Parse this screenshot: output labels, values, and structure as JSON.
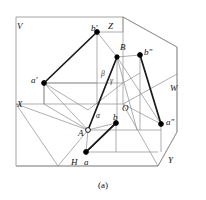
{
  "figure": {
    "caption": "(a)",
    "colors": {
      "frame": "#9a9a9a",
      "thin_line": "#8d8d8d",
      "bold_line": "#1a1a1a",
      "point_fill": "#000000",
      "point_open_fill": "#ffffff",
      "text": "#111111",
      "background": "#ffffff"
    },
    "plane_labels": [
      {
        "id": "plane-v",
        "text": "V",
        "x": 17,
        "y": 22
      },
      {
        "id": "plane-w",
        "text": "W",
        "x": 170,
        "y": 84
      },
      {
        "id": "plane-h",
        "text": "H",
        "x": 71,
        "y": 158
      }
    ],
    "axis_labels": [
      {
        "id": "axis-z",
        "text": "Z",
        "x": 108,
        "y": 22
      },
      {
        "id": "axis-x",
        "text": "X",
        "x": 17,
        "y": 100
      },
      {
        "id": "axis-y",
        "text": "Y",
        "x": 168,
        "y": 156
      },
      {
        "id": "axis-o",
        "text": "O",
        "x": 122,
        "y": 104
      }
    ],
    "point_labels": [
      {
        "id": "point-b-prime",
        "text": "b'",
        "x": 91,
        "y": 24
      },
      {
        "id": "point-b",
        "text": "B",
        "x": 120,
        "y": 43
      },
      {
        "id": "point-b-dprime",
        "text": "b\"",
        "x": 144,
        "y": 48
      },
      {
        "id": "point-a-prime",
        "text": "a'",
        "x": 31,
        "y": 76
      },
      {
        "id": "point-a-dprime",
        "text": "a\"",
        "x": 166,
        "y": 118
      },
      {
        "id": "point-b-lower",
        "text": "b",
        "x": 113,
        "y": 113
      },
      {
        "id": "point-a-upper",
        "text": "A",
        "x": 78,
        "y": 129
      },
      {
        "id": "point-a-lower",
        "text": "a",
        "x": 84,
        "y": 158
      }
    ],
    "angle_labels": [
      {
        "id": "angle-beta",
        "text": "β",
        "x": 101,
        "y": 70
      },
      {
        "id": "angle-gamma",
        "text": "γ",
        "x": 110,
        "y": 77
      },
      {
        "id": "angle-alpha",
        "text": "α",
        "x": 96,
        "y": 112
      }
    ],
    "points": [
      {
        "id": "vertex-b-prime",
        "cx": 97,
        "cy": 32,
        "r": 2.4,
        "filled": true
      },
      {
        "id": "vertex-B",
        "cx": 117,
        "cy": 57,
        "r": 2.2,
        "filled": true
      },
      {
        "id": "vertex-b-dprime",
        "cx": 140,
        "cy": 55,
        "r": 2.4,
        "filled": true
      },
      {
        "id": "vertex-a-prime",
        "cx": 44,
        "cy": 83,
        "r": 2.4,
        "filled": true
      },
      {
        "id": "vertex-a-dprime",
        "cx": 161,
        "cy": 124,
        "r": 2.4,
        "filled": true
      },
      {
        "id": "vertex-b-lower",
        "cx": 116,
        "cy": 123,
        "r": 2.4,
        "filled": true
      },
      {
        "id": "vertex-A",
        "cx": 88,
        "cy": 130,
        "r": 2.4,
        "filled": false
      },
      {
        "id": "vertex-a-lower",
        "cx": 86,
        "cy": 152,
        "r": 2.4,
        "filled": true
      }
    ],
    "frame_outline": "16,17 123,17 177,47 177,132 158,166 16,166 16,17",
    "bold_segments": [
      {
        "id": "seg-a-prime-b-prime",
        "x1": 44,
        "y1": 83,
        "x2": 97,
        "y2": 32
      },
      {
        "id": "seg-A-B",
        "x1": 88,
        "y1": 130,
        "x2": 117,
        "y2": 57
      },
      {
        "id": "seg-a-b",
        "x1": 86,
        "y1": 152,
        "x2": 116,
        "y2": 123
      },
      {
        "id": "seg-b-dprime-a-dprime",
        "x1": 140,
        "y1": 55,
        "x2": 161,
        "y2": 124
      },
      {
        "id": "seg-a-lower-to-a-dprime",
        "x1": 86,
        "y1": 152,
        "x2": 116,
        "y2": 123
      }
    ],
    "thin_segments": [
      {
        "id": "plane-v-right-edge",
        "x1": 123,
        "y1": 17,
        "x2": 123,
        "y2": 104
      },
      {
        "id": "axis-x-line",
        "x1": 16,
        "y1": 104,
        "x2": 123,
        "y2": 104
      },
      {
        "id": "axis-oy-line",
        "x1": 123,
        "y1": 104,
        "x2": 158,
        "y2": 166
      },
      {
        "id": "axis-ow-line",
        "x1": 123,
        "y1": 104,
        "x2": 177,
        "y2": 74
      },
      {
        "id": "h-plane-front",
        "x1": 16,
        "y1": 166,
        "x2": 158,
        "y2": 166
      },
      {
        "id": "h-plane-left-diag",
        "x1": 16,
        "y1": 104,
        "x2": 58,
        "y2": 166
      },
      {
        "id": "w-plane-upper",
        "x1": 123,
        "y1": 17,
        "x2": 177,
        "y2": 47
      },
      {
        "id": "proj-a-prime-down",
        "x1": 44,
        "y1": 83,
        "x2": 44,
        "y2": 104
      },
      {
        "id": "proj-a-prime-right",
        "x1": 44,
        "y1": 83,
        "x2": 123,
        "y2": 83
      },
      {
        "id": "proj-b-prime-down",
        "x1": 97,
        "y1": 32,
        "x2": 97,
        "y2": 104
      },
      {
        "id": "proj-b-prime-right",
        "x1": 97,
        "y1": 32,
        "x2": 123,
        "y2": 32
      },
      {
        "id": "proj-B-vert",
        "x1": 117,
        "y1": 57,
        "x2": 117,
        "y2": 123
      },
      {
        "id": "proj-B-to-b-dprime",
        "x1": 117,
        "y1": 57,
        "x2": 140,
        "y2": 55
      },
      {
        "id": "proj-B-to-b-prime",
        "x1": 97,
        "y1": 32,
        "x2": 117,
        "y2": 57
      },
      {
        "id": "proj-A-to-a-prime",
        "x1": 44,
        "y1": 83,
        "x2": 88,
        "y2": 130
      },
      {
        "id": "proj-A-to-a-lower",
        "x1": 88,
        "y1": 130,
        "x2": 86,
        "y2": 152
      },
      {
        "id": "proj-A-to-b-lower",
        "x1": 88,
        "y1": 130,
        "x2": 116,
        "y2": 123
      },
      {
        "id": "proj-A-horiz",
        "x1": 88,
        "y1": 130,
        "x2": 161,
        "y2": 130
      },
      {
        "id": "proj-a-lower-horiz",
        "x1": 86,
        "y1": 152,
        "x2": 158,
        "y2": 152
      },
      {
        "id": "proj-a-dprime-vert",
        "x1": 161,
        "y1": 124,
        "x2": 161,
        "y2": 152
      },
      {
        "id": "proj-b-lower-vert",
        "x1": 116,
        "y1": 123,
        "x2": 116,
        "y2": 152
      },
      {
        "id": "proj-B-to-a-dprime",
        "x1": 117,
        "y1": 57,
        "x2": 161,
        "y2": 124
      },
      {
        "id": "proj-B-to-b-lower-diag",
        "x1": 117,
        "y1": 57,
        "x2": 137,
        "y2": 130
      },
      {
        "id": "aux-a-prime-to-A",
        "x1": 44,
        "y1": 104,
        "x2": 88,
        "y2": 130
      },
      {
        "id": "aux-v-bottom",
        "x1": 44,
        "y1": 83,
        "x2": 97,
        "y2": 83
      },
      {
        "id": "aux-box-left",
        "x1": 44,
        "y1": 104,
        "x2": 44,
        "y2": 83
      },
      {
        "id": "aux-inner-quad",
        "x1": 44,
        "y1": 83,
        "x2": 88,
        "y2": 110
      },
      {
        "id": "aux-inner-quad-2",
        "x1": 88,
        "y1": 110,
        "x2": 123,
        "y2": 83
      },
      {
        "id": "aux-h-diag-right",
        "x1": 88,
        "y1": 130,
        "x2": 58,
        "y2": 166
      },
      {
        "id": "aux-h-left",
        "x1": 16,
        "y1": 104,
        "x2": 88,
        "y2": 130
      },
      {
        "id": "aux-b-dprime-vert",
        "x1": 140,
        "y1": 55,
        "x2": 140,
        "y2": 130
      },
      {
        "id": "aux-w-outer",
        "x1": 177,
        "y1": 47,
        "x2": 177,
        "y2": 132
      },
      {
        "id": "aux-w-bottom",
        "x1": 177,
        "y1": 132,
        "x2": 158,
        "y2": 166
      },
      {
        "id": "aux-o-to-a-dprime",
        "x1": 123,
        "y1": 104,
        "x2": 161,
        "y2": 124
      },
      {
        "id": "aux-o-box-top",
        "x1": 123,
        "y1": 83,
        "x2": 140,
        "y2": 73
      },
      {
        "id": "aux-corner-z",
        "x1": 123,
        "y1": 17,
        "x2": 123,
        "y2": 32
      }
    ]
  }
}
